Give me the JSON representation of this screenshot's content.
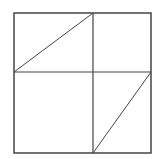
{
  "diagram": {
    "stroke_color": "#444444",
    "background": "#ffffff",
    "outer_square": {
      "x": 14,
      "y": 13,
      "width": 137,
      "height": 140
    },
    "vertical_divider": {
      "x": 93,
      "y1": 13,
      "y2": 153
    },
    "horizontal_divider": {
      "y": 72,
      "x1": 14,
      "x2": 151
    },
    "diagonals": [
      {
        "cell": "top-left",
        "x1": 14,
        "y1": 72,
        "x2": 93,
        "y2": 13
      },
      {
        "cell": "bottom-right",
        "x1": 93,
        "y1": 153,
        "x2": 151,
        "y2": 72
      }
    ]
  }
}
